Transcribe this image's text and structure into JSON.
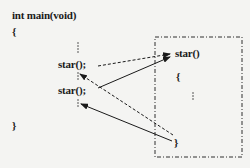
{
  "diagram": {
    "main_function": {
      "signature": "int main(void)",
      "open_brace": "{",
      "calls": [
        {
          "label": "star();"
        },
        {
          "label": "star();"
        }
      ],
      "close_brace": "}"
    },
    "called_function": {
      "signature": "star()",
      "open_brace": "{",
      "close_brace": "}",
      "boundary_style": "dash-dot"
    },
    "arrows": [
      {
        "from": "first star(); call",
        "to": "star() entry",
        "style": "dashed"
      },
      {
        "from": "second star(); call",
        "to": "star() entry",
        "style": "solid"
      },
      {
        "from": "star() closing brace",
        "to": "return after first call",
        "style": "dashed"
      },
      {
        "from": "star() closing brace",
        "to": "return after second call",
        "style": "solid"
      }
    ],
    "colors": {
      "ink": "#1a1a1a",
      "background": "#f4f4f2"
    }
  }
}
